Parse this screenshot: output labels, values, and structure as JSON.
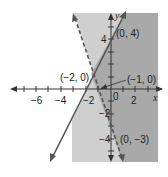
{
  "figure": {
    "type": "system-of-linear-inequalities",
    "colors": {
      "background": "#ffffff",
      "region_light": "#cfcfcf",
      "region_dark": "#a9a9a9",
      "line": "#555555",
      "axis": "#333333"
    },
    "axes": {
      "x_label": "x",
      "y_label": "y",
      "x_tick_labels": [
        "−6",
        "−4",
        "−2",
        "0",
        "2"
      ],
      "y_tick_labels": [
        "4",
        "−2",
        "−4"
      ],
      "origin_label": "0"
    },
    "lines": [
      {
        "name": "solid-line",
        "style": "solid",
        "equation": "y = 2x + 4",
        "points": [
          "(−2, 0)",
          "(0, 4)"
        ]
      },
      {
        "name": "dashed-line",
        "style": "dashed",
        "equation": "y = −3x − 3",
        "points": [
          "(−1, 0)",
          "(0, −3)"
        ]
      }
    ],
    "point_labels": {
      "p_0_4": "(0, 4)",
      "p_m2_0": "(−2, 0)",
      "p_m1_0": "(−1, 0)",
      "p_0_m3": "(0, −3)"
    }
  }
}
